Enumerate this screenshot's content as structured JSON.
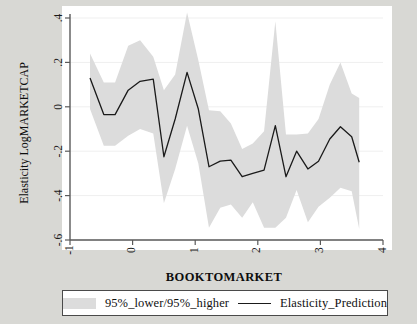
{
  "chart_data": {
    "type": "line",
    "title": "",
    "xlabel": "BOOKTOMARKET",
    "ylabel": "Elasticity LogMARKETCAP",
    "xlim": [
      -1,
      4
    ],
    "ylim": [
      -0.6,
      0.4
    ],
    "xticks": [
      "-1",
      "0",
      "1",
      "2",
      "3",
      "4"
    ],
    "xtick_values": [
      -1,
      0,
      1,
      2,
      3,
      4
    ],
    "yticks": [
      ".4",
      ".2",
      "0",
      "-.2",
      "-.4",
      "-.6"
    ],
    "ytick_values": [
      0.4,
      0.2,
      0,
      -0.2,
      -0.4,
      -0.6
    ],
    "grid": true,
    "legend_position": "below",
    "x": [
      -0.68,
      -0.46,
      -0.28,
      -0.07,
      0.12,
      0.33,
      0.5,
      0.68,
      0.87,
      1.05,
      1.22,
      1.4,
      1.57,
      1.75,
      1.92,
      2.1,
      2.28,
      2.45,
      2.62,
      2.8,
      2.97,
      3.15,
      3.32,
      3.5,
      3.62
    ],
    "series": [
      {
        "name": "Elasticity_Prediction",
        "color": "#1a1a1a",
        "values": [
          0.13,
          -0.035,
          -0.035,
          0.075,
          0.115,
          0.125,
          -0.225,
          -0.055,
          0.155,
          -0.01,
          -0.27,
          -0.245,
          -0.24,
          -0.315,
          -0.3,
          -0.285,
          -0.085,
          -0.315,
          -0.2,
          -0.28,
          -0.245,
          -0.145,
          -0.09,
          -0.135,
          -0.25
        ]
      },
      {
        "name": "95%_lower",
        "color": "#dcdcdc",
        "values": [
          0.24,
          0.11,
          0.11,
          0.275,
          0.3,
          0.225,
          0.075,
          0.145,
          0.425,
          0.21,
          -0.015,
          -0.02,
          -0.075,
          -0.19,
          -0.165,
          -0.11,
          0.385,
          -0.125,
          -0.125,
          -0.12,
          -0.055,
          0.1,
          0.2,
          0.06,
          0.04
        ]
      },
      {
        "name": "95%_higher",
        "color": "#dcdcdc",
        "values": [
          -0.01,
          -0.175,
          -0.175,
          -0.13,
          -0.1,
          -0.12,
          -0.435,
          -0.28,
          -0.085,
          -0.255,
          -0.545,
          -0.455,
          -0.44,
          -0.5,
          -0.43,
          -0.545,
          -0.545,
          -0.5,
          -0.375,
          -0.52,
          -0.45,
          -0.41,
          -0.365,
          -0.38,
          -0.55
        ]
      }
    ],
    "legend": [
      {
        "label": "95%_lower/95%_higher",
        "marker": "band",
        "color": "#dcdcdc"
      },
      {
        "label": "Elasticity_Prediction",
        "marker": "line",
        "color": "#1a1a1a"
      }
    ],
    "colors": {
      "band": "#dcdcdc",
      "line": "#1a1a1a",
      "plot_background": "#ffffff",
      "page_background": "#d8d8d4",
      "axis": "#5a5a5a",
      "grid": "#efefef"
    }
  }
}
